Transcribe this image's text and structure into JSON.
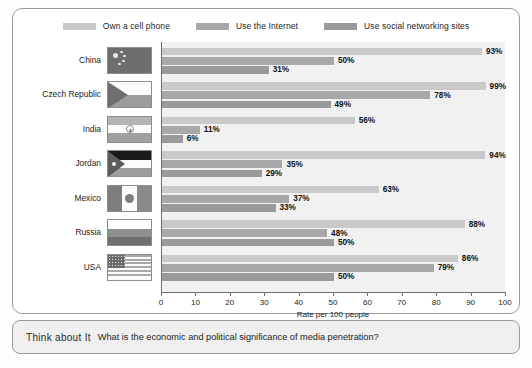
{
  "legend": {
    "entries": [
      {
        "label": "Own a cell phone",
        "color": "#c9c9c9",
        "key": "own_cell_phone"
      },
      {
        "label": "Use the Internet",
        "color": "#a8a8a8",
        "key": "use_internet"
      },
      {
        "label": "Use social networking sites",
        "color": "#9a9a9a",
        "key": "use_social"
      }
    ]
  },
  "axis": {
    "title": "Rate per 100 people",
    "ticks": [
      "0",
      "10",
      "20",
      "30",
      "40",
      "50",
      "60",
      "70",
      "80",
      "90",
      "100"
    ]
  },
  "callout": {
    "title": "Think about It",
    "question": "What is the economic and political significance of media penetration?"
  },
  "countries": [
    {
      "name": "China",
      "flag": "cn",
      "values": [
        "93%",
        "50%",
        "31%"
      ]
    },
    {
      "name": "Czech Republic",
      "flag": "cz",
      "values": [
        "99%",
        "78%",
        "49%"
      ]
    },
    {
      "name": "India",
      "flag": "in",
      "values": [
        "56%",
        "11%",
        "6%"
      ]
    },
    {
      "name": "Jordan",
      "flag": "jo",
      "values": [
        "94%",
        "35%",
        "29%"
      ]
    },
    {
      "name": "Mexico",
      "flag": "mx",
      "values": [
        "63%",
        "37%",
        "33%"
      ]
    },
    {
      "name": "Russia",
      "flag": "ru",
      "values": [
        "88%",
        "48%",
        "50%"
      ]
    },
    {
      "name": "USA",
      "flag": "us",
      "values": [
        "86%",
        "79%",
        "50%"
      ]
    }
  ],
  "chart_data": {
    "type": "bar",
    "orientation": "horizontal",
    "title": "",
    "xlabel": "Rate per 100 people",
    "ylabel": "",
    "xlim": [
      0,
      100
    ],
    "xticks": [
      0,
      10,
      20,
      30,
      40,
      50,
      60,
      70,
      80,
      90,
      100
    ],
    "grid": false,
    "legend_position": "top-center",
    "categories": [
      "China",
      "Czech Republic",
      "India",
      "Jordan",
      "Mexico",
      "Russia",
      "USA"
    ],
    "series": [
      {
        "name": "Own a cell phone",
        "color": "#c9c9c9",
        "values": [
          93,
          99,
          56,
          94,
          63,
          88,
          86
        ]
      },
      {
        "name": "Use the Internet",
        "color": "#a8a8a8",
        "values": [
          50,
          78,
          11,
          35,
          37,
          48,
          79
        ]
      },
      {
        "name": "Use social networking sites",
        "color": "#9a9a9a",
        "values": [
          31,
          49,
          6,
          29,
          33,
          50,
          50
        ]
      }
    ],
    "annotations": [
      "Think about It",
      "What is the economic and political significance of media penetration?"
    ]
  }
}
